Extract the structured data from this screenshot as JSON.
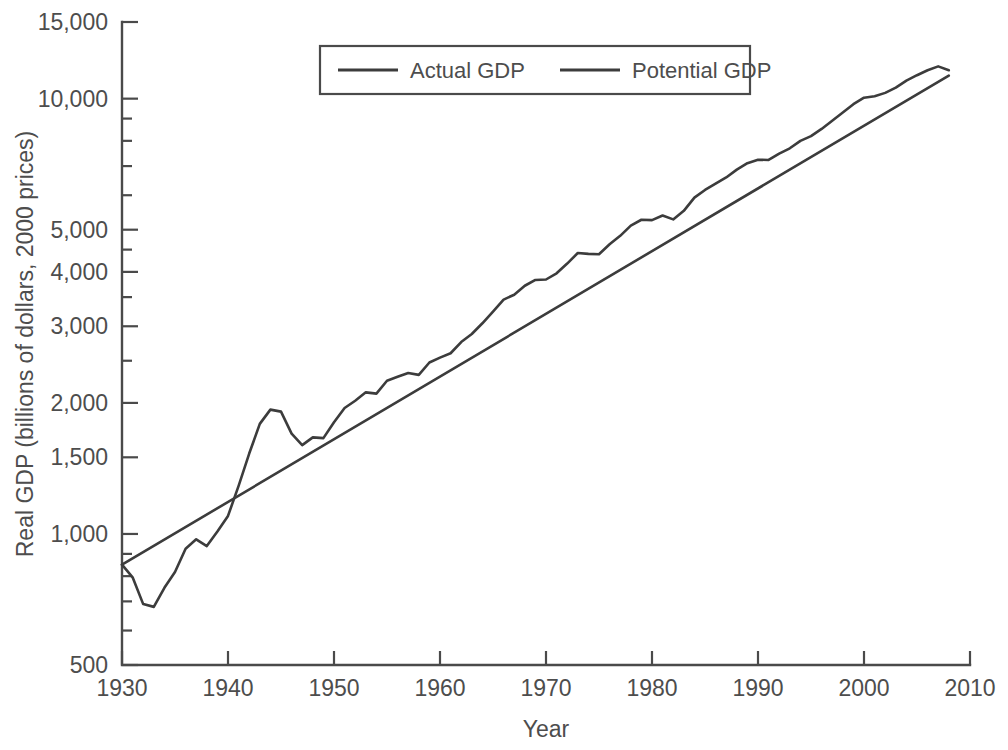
{
  "chart_data": {
    "type": "line",
    "title": "",
    "xlabel": "Year",
    "ylabel": "Real GDP (billions of dollars, 2000 prices)",
    "xlim": [
      1930,
      2010
    ],
    "ylim": [
      500,
      15000
    ],
    "yscale": "log",
    "grid": false,
    "legend_position": "top-center",
    "xticks": [
      1930,
      1940,
      1950,
      1960,
      1970,
      1980,
      1990,
      2000,
      2010
    ],
    "xtick_labels": [
      "1930",
      "1940",
      "1950",
      "1960",
      "1970",
      "1980",
      "1990",
      "2000",
      "2010"
    ],
    "yticks": [
      500,
      1000,
      1500,
      2000,
      3000,
      4000,
      5000,
      10000,
      15000
    ],
    "ytick_labels": [
      "500",
      "1,000",
      "1,500",
      "2,000",
      "3,000",
      "4,000",
      "5,000",
      "10,000",
      "15,000"
    ],
    "ytick_minor": [
      600,
      700,
      800,
      900,
      2500,
      3500,
      4500,
      6000,
      7000,
      8000,
      9000
    ],
    "series": [
      {
        "name": "Actual GDP",
        "color": "#3c3c3c",
        "width": 2.6,
        "x": [
          1930,
          1931,
          1932,
          1933,
          1934,
          1935,
          1936,
          1937,
          1938,
          1939,
          1940,
          1941,
          1942,
          1943,
          1944,
          1945,
          1946,
          1947,
          1948,
          1949,
          1950,
          1951,
          1952,
          1953,
          1954,
          1955,
          1956,
          1957,
          1958,
          1959,
          1960,
          1961,
          1962,
          1963,
          1964,
          1965,
          1966,
          1967,
          1968,
          1969,
          1970,
          1971,
          1972,
          1973,
          1974,
          1975,
          1976,
          1977,
          1978,
          1979,
          1980,
          1981,
          1982,
          1983,
          1984,
          1985,
          1986,
          1987,
          1988,
          1989,
          1990,
          1991,
          1992,
          1993,
          1994,
          1995,
          1996,
          1997,
          1998,
          1999,
          2000,
          2001,
          2002,
          2003,
          2004,
          2005,
          2006,
          2007,
          2008
        ],
        "y": [
          850,
          795,
          690,
          680,
          752,
          818,
          925,
          972,
          938,
          1013,
          1100,
          1290,
          1530,
          1790,
          1930,
          1910,
          1700,
          1600,
          1667,
          1660,
          1805,
          1947,
          2023,
          2115,
          2101,
          2249,
          2296,
          2342,
          2320,
          2477,
          2542,
          2601,
          2760,
          2880,
          3048,
          3242,
          3455,
          3545,
          3717,
          3833,
          3842,
          3970,
          4180,
          4420,
          4400,
          4390,
          4630,
          4840,
          5110,
          5270,
          5260,
          5390,
          5280,
          5525,
          5925,
          6170,
          6380,
          6590,
          6870,
          7110,
          7240,
          7230,
          7480,
          7690,
          8000,
          8200,
          8520,
          8900,
          9290,
          9710,
          10050,
          10130,
          10310,
          10600,
          11000,
          11320,
          11620,
          11860,
          11620
        ]
      },
      {
        "name": "Potential GDP",
        "color": "#3c3c3c",
        "width": 2.6,
        "x": [
          1930,
          2008
        ],
        "y": [
          850,
          11300
        ]
      }
    ],
    "notes": {
      "depression_trough_year": 1933,
      "depression_trough_value": 680,
      "wwii_peak_year": 1944,
      "wwii_peak_value": 1930,
      "start_value": 850,
      "end_actual_value": 11620,
      "end_potential_value": 11300
    }
  },
  "legend": {
    "entries": [
      {
        "label": "Actual GDP"
      },
      {
        "label": "Potential GDP"
      }
    ]
  },
  "axes": {
    "x_title": "Year",
    "y_title": "Real GDP (billions of dollars, 2000 prices)"
  }
}
